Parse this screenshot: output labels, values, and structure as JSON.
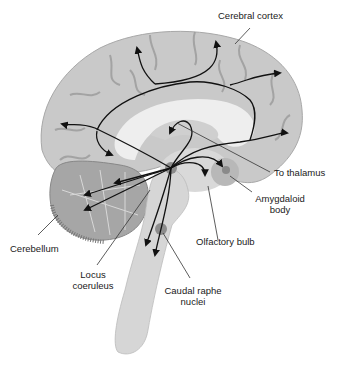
{
  "diagram": {
    "colors": {
      "brain_fill": "#c9c9c9",
      "sulci": "#9a9a9a",
      "white_matter": "#e6e6e6",
      "brainstem": "#d4d4d4",
      "cerebellum": "#9c9c9c",
      "nucleus_dot": "#8a8a8a",
      "arrows": "#111111",
      "leader_lines": "#333333"
    },
    "labels": {
      "cerebral_cortex": "Cerebral cortex",
      "to_thalamus": "To thalamus",
      "amygdaloid_body_line1": "Amygdaloid",
      "amygdaloid_body_line2": "body",
      "olfactory_bulb": "Olfactory bulb",
      "cerebellum": "Cerebellum",
      "locus_coeruleus_line1": "Locus",
      "locus_coeruleus_line2": "coeruleus",
      "caudal_raphe_line1": "Caudal raphe",
      "caudal_raphe_line2": "nuclei"
    }
  }
}
